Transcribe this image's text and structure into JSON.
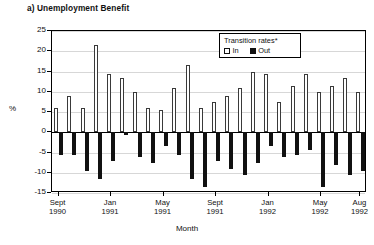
{
  "panel": {
    "title": "a) Unemployment Benefit"
  },
  "legend": {
    "title": "Transition rates*",
    "entries": [
      {
        "label": "In",
        "swatch": "hollow-square",
        "color": "#ffffff"
      },
      {
        "label": "Out",
        "swatch": "filled-square",
        "color": "#111111"
      }
    ]
  },
  "axes": {
    "y_title": "%",
    "x_title": "Month",
    "y_ticks": [
      25,
      20,
      15,
      10,
      5,
      0,
      -5,
      -10,
      -15
    ],
    "x_ticks": [
      {
        "month": "Sept",
        "year": "1990",
        "index": 0
      },
      {
        "month": "Jan",
        "year": "1991",
        "index": 4
      },
      {
        "month": "May",
        "year": "1991",
        "index": 8
      },
      {
        "month": "Sept",
        "year": "1991",
        "index": 12
      },
      {
        "month": "Jan",
        "year": "1992",
        "index": 16
      },
      {
        "month": "May",
        "year": "1992",
        "index": 20
      },
      {
        "month": "Aug",
        "year": "1992",
        "index": 23
      }
    ]
  },
  "chart_data": {
    "type": "bar",
    "title": "a) Unemployment Benefit",
    "xlabel": "Month",
    "ylabel": "%",
    "ylim": [
      -15,
      25
    ],
    "ytick_step": 5,
    "grid": true,
    "legend_position": "inside-top-right",
    "legend_title": "Transition rates*",
    "categories": [
      "Sept 1990",
      "Oct 1990",
      "Nov 1990",
      "Dec 1990",
      "Jan 1991",
      "Feb 1991",
      "Mar 1991",
      "Apr 1991",
      "May 1991",
      "Jun 1991",
      "Jul 1991",
      "Aug 1991",
      "Sept 1991",
      "Oct 1991",
      "Nov 1991",
      "Dec 1991",
      "Jan 1992",
      "Feb 1992",
      "Mar 1992",
      "Apr 1992",
      "May 1992",
      "Jun 1992",
      "Jul 1992",
      "Aug 1992"
    ],
    "series": [
      {
        "name": "In",
        "color": "#ffffff",
        "values": [
          6,
          9,
          6,
          21.5,
          14.5,
          13.5,
          10,
          6,
          5.5,
          11,
          16.5,
          6,
          7.5,
          9,
          11,
          15,
          14.5,
          7.5,
          11.5,
          14.5,
          10,
          11.5,
          13.5,
          10
        ]
      },
      {
        "name": "Out",
        "color": "#111111",
        "values": [
          -5.5,
          -5.5,
          -9.5,
          -11.5,
          -7,
          -0.8,
          -6,
          -7.5,
          -3.5,
          -5.5,
          -11.5,
          -13.5,
          -7,
          -9,
          -10.5,
          -7.5,
          -3.5,
          -6,
          -5.5,
          -4.5,
          -13.5,
          -8,
          -10.5,
          -9.5
        ]
      }
    ]
  }
}
